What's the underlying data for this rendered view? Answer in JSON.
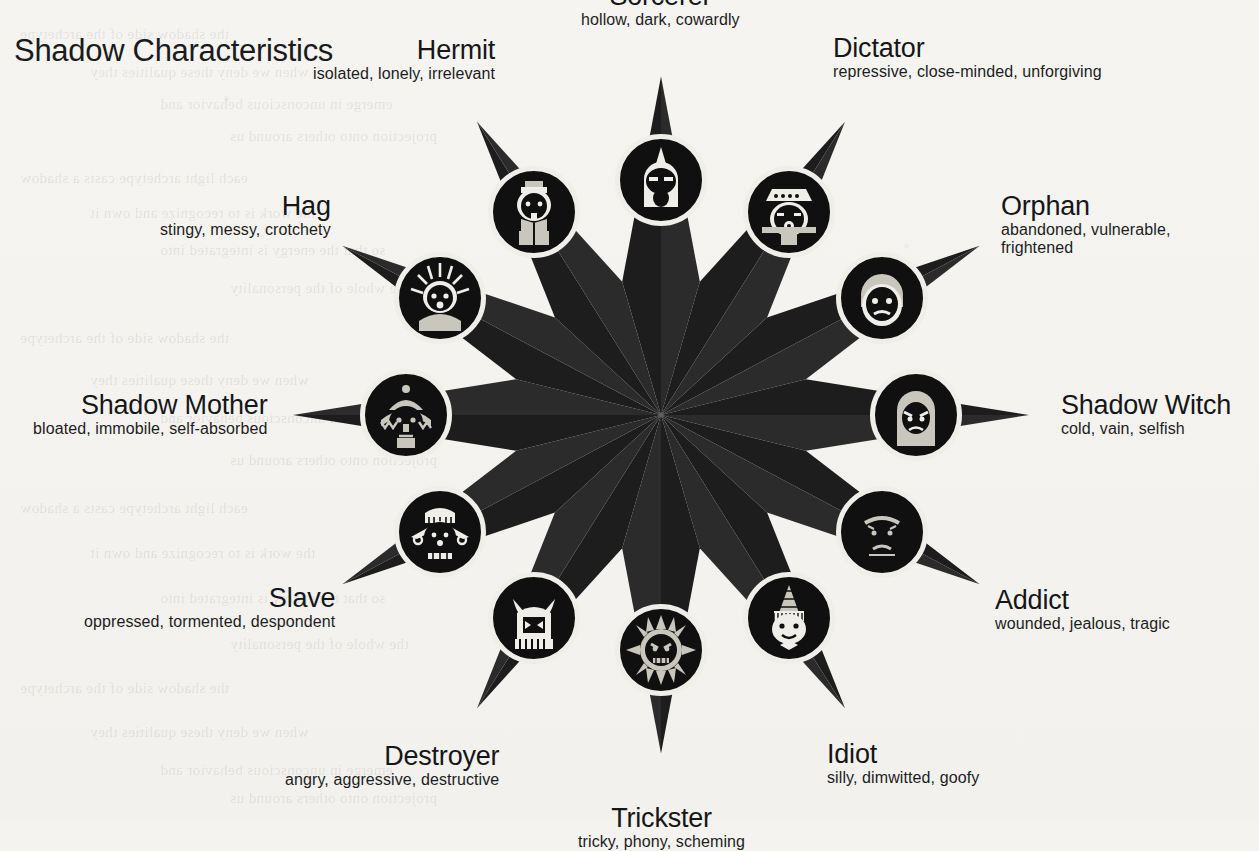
{
  "page": {
    "title": "Shadow Characteristics",
    "background_color": "#f4f3f0",
    "ink_color": "#161616",
    "star": {
      "points": 12,
      "segment_colors": [
        "#1d1d1d",
        "#2b2b2b"
      ],
      "center_x": 660,
      "center_y": 415
    }
  },
  "ghost_text": [
    "the shadow side of the archetype",
    "when we deny these qualities they",
    "emerge in unconscious behavior and",
    "projection onto others around us",
    "each light archetype casts a shadow",
    "the work is to recognize and own it",
    "so that the energy is integrated into",
    "the whole of the personality"
  ],
  "archetypes": [
    {
      "id": "sorcerer",
      "name": "Sorcerer",
      "traits": "hollow, dark, cowardly",
      "icon": "sorcerer-hooded-face-icon",
      "align": "center",
      "angle_deg": 270
    },
    {
      "id": "dictator",
      "name": "Dictator",
      "traits": "repressive, close-minded, unforgiving",
      "icon": "dictator-military-cap-icon",
      "align": "left",
      "angle_deg": 300
    },
    {
      "id": "orphan",
      "name": "Orphan",
      "traits": "abandoned, vulnerable, frightened",
      "icon": "orphan-sad-child-icon",
      "align": "left",
      "angle_deg": 330
    },
    {
      "id": "shadow-witch",
      "name": "Shadow Witch",
      "traits": "cold, vain, selfish",
      "icon": "shadow-witch-veiled-face-icon",
      "align": "left",
      "angle_deg": 0
    },
    {
      "id": "addict",
      "name": "Addict",
      "traits": "wounded, jealous, tragic",
      "icon": "addict-drooping-face-icon",
      "align": "left",
      "angle_deg": 30
    },
    {
      "id": "idiot",
      "name": "Idiot",
      "traits": "silly, dimwitted, goofy",
      "icon": "idiot-dunce-cap-icon",
      "align": "left",
      "angle_deg": 60
    },
    {
      "id": "trickster",
      "name": "Trickster",
      "traits": "tricky, phony, scheming",
      "icon": "trickster-sun-mask-icon",
      "align": "center",
      "angle_deg": 90
    },
    {
      "id": "destroyer",
      "name": "Destroyer",
      "traits": "angry, aggressive, destructive",
      "icon": "destroyer-horned-beast-icon",
      "align": "right",
      "angle_deg": 120
    },
    {
      "id": "slave",
      "name": "Slave",
      "traits": "oppressed, tormented, despondent",
      "icon": "slave-shackled-face-icon",
      "align": "right",
      "angle_deg": 150
    },
    {
      "id": "shadow-mother",
      "name": "Shadow Mother",
      "traits": "bloated, immobile, self-absorbed",
      "icon": "shadow-mother-bonnet-face-icon",
      "align": "right",
      "angle_deg": 180
    },
    {
      "id": "hag",
      "name": "Hag",
      "traits": "stingy, messy, crotchety",
      "icon": "hag-wild-hair-icon",
      "align": "right",
      "angle_deg": 210
    },
    {
      "id": "hermit",
      "name": "Hermit",
      "traits": "isolated, lonely, irrelevant",
      "icon": "hermit-bearded-face-icon",
      "align": "right",
      "angle_deg": 240
    }
  ]
}
